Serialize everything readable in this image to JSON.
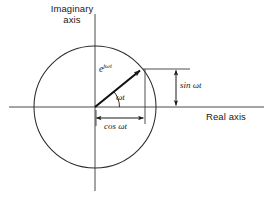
{
  "figure": {
    "type": "complex-plane-phasor-diagram",
    "background_color": "#ffffff",
    "stroke_color": "#1a1a1a",
    "axes": {
      "imaginary_label_line1": "Imaginary",
      "imaginary_label_line2": "axis",
      "real_label": "Real axis"
    },
    "labels": {
      "phasor_base": "e",
      "phasor_exponent": "jωt",
      "angle": "ωt",
      "sine_projection": "sin ωt",
      "cosine_projection": "cos ωt"
    },
    "geometry": {
      "origin_x": 95,
      "origin_y": 107,
      "circle_radius": 61,
      "phasor_angle_degrees": 40,
      "phasor_tip_x": 142,
      "phasor_tip_y": 68
    }
  }
}
